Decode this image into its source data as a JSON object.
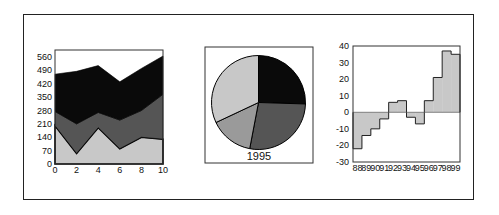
{
  "figure": {
    "panels": 3,
    "frame_color": "#222222"
  },
  "chart_data": [
    {
      "type": "area",
      "title": "",
      "xlabel": "",
      "ylabel": "",
      "stacked": true,
      "x": [
        0,
        2,
        4,
        6,
        8,
        10
      ],
      "x_ticks": [
        "0",
        "2",
        "4",
        "6",
        "8",
        "10"
      ],
      "y_ticks": [
        "0",
        "70",
        "140",
        "210",
        "280",
        "350",
        "420",
        "490",
        "560"
      ],
      "xlim": [
        0,
        10
      ],
      "ylim": [
        0,
        595
      ],
      "grid": false,
      "series": [
        {
          "name": "layer-1",
          "color": "#c8c8c8",
          "top": [
            200,
            55,
            190,
            80,
            140,
            130
          ]
        },
        {
          "name": "layer-2",
          "color": "#555555",
          "top": [
            275,
            210,
            270,
            230,
            280,
            365
          ]
        },
        {
          "name": "layer-3",
          "color": "#0a0a0a",
          "top": [
            470,
            485,
            515,
            430,
            500,
            565
          ]
        }
      ]
    },
    {
      "type": "pie",
      "title": "",
      "caption": "1995",
      "start_angle_deg": 0,
      "direction": "clockwise",
      "slices": [
        {
          "label": "slice-1",
          "value": 25.5,
          "color": "#0a0a0a"
        },
        {
          "label": "slice-2",
          "value": 27.5,
          "color": "#555555"
        },
        {
          "label": "slice-3",
          "value": 15.0,
          "color": "#9a9a9a"
        },
        {
          "label": "slice-4",
          "value": 32.0,
          "color": "#c8c8c8"
        }
      ]
    },
    {
      "type": "bar",
      "style": "step",
      "title": "",
      "xlabel": "",
      "ylabel": "",
      "categories": [
        "88",
        "89",
        "90",
        "91",
        "92",
        "93",
        "94",
        "95",
        "96",
        "97",
        "98",
        "99"
      ],
      "values": [
        -22,
        -14,
        -10,
        -4,
        6,
        7,
        -3,
        -7,
        7,
        21,
        37,
        35
      ],
      "y_ticks": [
        "40",
        "30",
        "20",
        "10",
        "0",
        "-10",
        "-20",
        "-30"
      ],
      "ylim": [
        -30,
        40
      ],
      "grid": false,
      "fill_color": "#c8c8c8",
      "baseline": 0
    }
  ]
}
